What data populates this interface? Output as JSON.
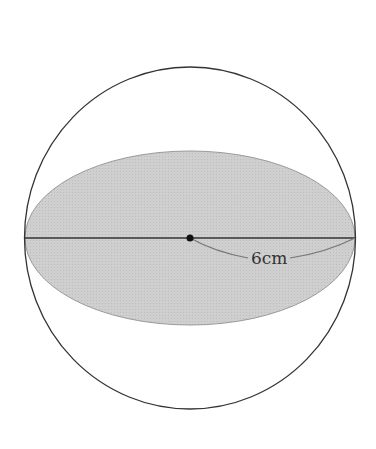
{
  "diagram": {
    "sphere": {
      "cx": 190,
      "cy": 238,
      "rx": 165,
      "ry": 171,
      "stroke": "#333333"
    },
    "cross_section": {
      "cx": 190,
      "cy": 238,
      "rx": 165,
      "ry": 87,
      "fill": "#c9c9c9"
    },
    "diameter_line": {
      "x1": 24,
      "x2": 355,
      "y": 238
    },
    "center_point": {
      "x": 190,
      "y": 238
    },
    "radius_label": "6cm"
  }
}
